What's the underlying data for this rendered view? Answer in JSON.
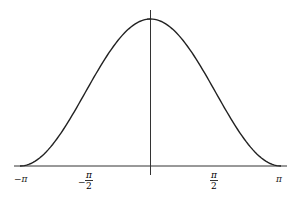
{
  "chart_data": {
    "type": "line",
    "title": "",
    "xlabel": "",
    "ylabel": "",
    "function": "(1 + cos x) / 2",
    "xlim": [
      -3.14159,
      3.14159
    ],
    "ylim": [
      0,
      1
    ],
    "grid": false,
    "legend": null,
    "x_ticks": [
      {
        "value": -3.14159,
        "label": "-π"
      },
      {
        "value": -1.5708,
        "label": "-π/2"
      },
      {
        "value": 1.5708,
        "label": "π/2"
      },
      {
        "value": 3.14159,
        "label": "π"
      }
    ],
    "series": [
      {
        "name": "curve",
        "x": [
          -3.14159,
          -2.3562,
          -1.5708,
          -0.7854,
          0,
          0.7854,
          1.5708,
          2.3562,
          3.14159
        ],
        "values": [
          0,
          0.146,
          0.5,
          0.854,
          1,
          0.854,
          0.5,
          0.146,
          0
        ]
      }
    ],
    "colors": {
      "curve": "#222222",
      "axes": "#333333"
    }
  },
  "labels": {
    "neg_pi": "−π",
    "neg_half_pi_sign": "−",
    "neg_half_pi_num": "π",
    "neg_half_pi_den": "2",
    "half_pi_num": "π",
    "half_pi_den": "2",
    "pi": "π"
  }
}
